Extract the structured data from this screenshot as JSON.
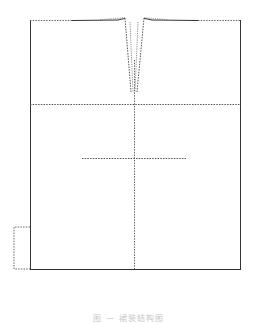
{
  "figure": {
    "type": "pattern-diagram",
    "caption": "图 — 裙装结构图",
    "colors": {
      "outline": "#333333",
      "dashed": "#555555",
      "background": "#ffffff",
      "caption": "#c8c8c8"
    }
  },
  "shapes": {
    "panel": {
      "x": 30,
      "y": 20,
      "width": 210,
      "height": 249
    },
    "hip_line_y": 104,
    "center_line_x": 134,
    "cross_line": {
      "y": 158,
      "x1": 82,
      "x2": 186
    },
    "side_bracket": {
      "x1": 14,
      "x2": 30,
      "y1": 227,
      "y2": 269
    },
    "dart": {
      "top_left_x": 124,
      "top_right_x": 145,
      "tip_x": 134,
      "top_y": 19,
      "tip_y": 92
    }
  }
}
